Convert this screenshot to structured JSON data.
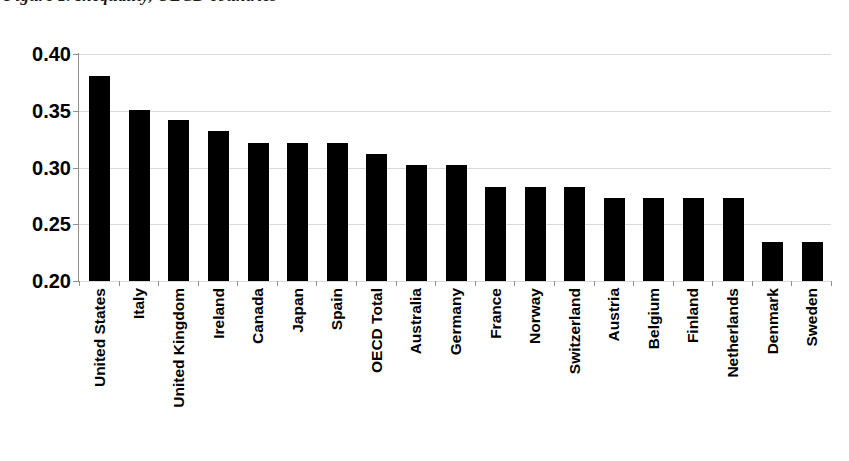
{
  "figure": {
    "clipped_title": "Figure 1. Inequality, OECD countries"
  },
  "chart_data": {
    "type": "bar",
    "title": "",
    "xlabel": "",
    "ylabel": "",
    "ylim": [
      0.2,
      0.4
    ],
    "ytick_labels": [
      "0.40",
      "0.35",
      "0.30",
      "0.25",
      "0.20"
    ],
    "ytick_values": [
      0.4,
      0.35,
      0.3,
      0.25,
      0.2
    ],
    "grid": true,
    "legend": null,
    "bar_color": "#000000",
    "gridline_color": "#d9d9d9",
    "axis_color": "#8f8f8f",
    "categories": [
      "United States",
      "Italy",
      "United Kingdom",
      "Ireland",
      "Canada",
      "Japan",
      "Spain",
      "OECD Total",
      "Australia",
      "Germany",
      "France",
      "Norway",
      "Switzerland",
      "Austria",
      "Belgium",
      "Finland",
      "Netherlands",
      "Denmark",
      "Sweden"
    ],
    "values": [
      0.381,
      0.351,
      0.342,
      0.332,
      0.322,
      0.322,
      0.322,
      0.312,
      0.302,
      0.302,
      0.283,
      0.283,
      0.283,
      0.273,
      0.273,
      0.273,
      0.273,
      0.234,
      0.234
    ]
  }
}
